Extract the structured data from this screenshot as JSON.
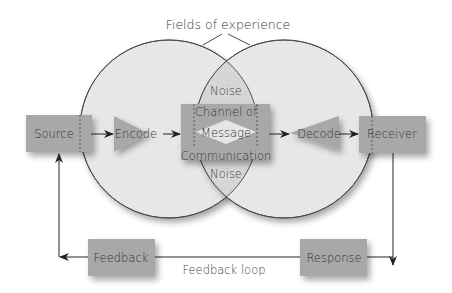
{
  "title": "Fields of experience",
  "nodes": {
    "source": "Source",
    "encode": "Encode",
    "channel_top": "Channel of",
    "message": "Message",
    "channel_bottom": "Communication",
    "decode": "Decode",
    "receiver": "Receiver",
    "response": "Response",
    "feedback": "Feedback"
  },
  "noise_top": "Noise",
  "noise_bottom": "Noise",
  "feedback_loop_label": "Feedback loop",
  "colors": {
    "box": "#a9a9a9",
    "circle_fill": "#e6e6e6",
    "overlap_fill": "#d9d9d9",
    "line": "#333333",
    "text": "#444444"
  }
}
